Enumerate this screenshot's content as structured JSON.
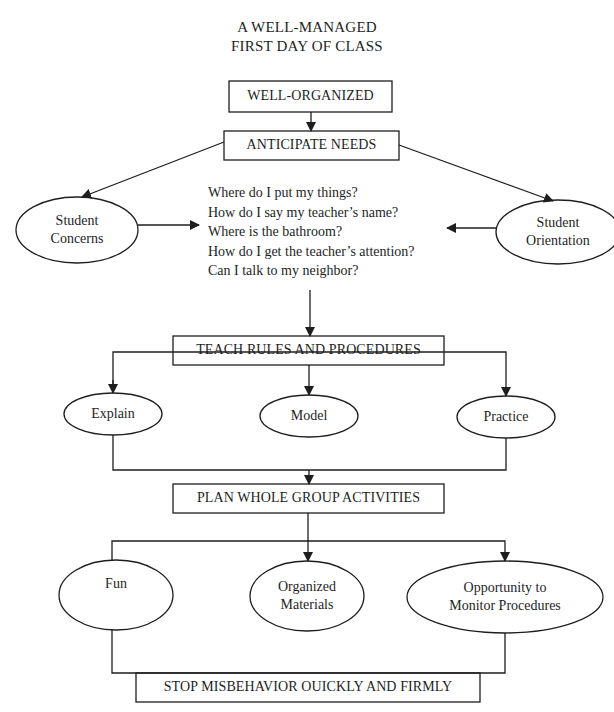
{
  "page": {
    "corner_mark": "g"
  },
  "diagram": {
    "title": {
      "line1": "A WELL-MANAGED",
      "line2": "FIRST DAY OF CLASS"
    },
    "nodes": {
      "well_organized": "WELL-ORGANIZED",
      "anticipate_needs": "ANTICIPATE NEEDS",
      "student_concerns": {
        "line1": "Student",
        "line2": "Concerns"
      },
      "student_orientation": {
        "line1": "Student",
        "line2": "Orientation"
      },
      "teach_rules": "TEACH RULES AND PROCEDURES",
      "explain": "Explain",
      "model": "Model",
      "practice": "Practice",
      "plan_activities": "PLAN WHOLE GROUP ACTIVITIES",
      "fun": "Fun",
      "organized_materials": {
        "line1": "Organized",
        "line2": "Materials"
      },
      "opportunity_monitor": {
        "line1": "Opportunity to",
        "line2": "Monitor Procedures"
      },
      "stop_misbehavior": "STOP MISBEHAVIOR OUICKLY AND FIRMLY"
    },
    "questions": [
      "Where do I put my things?",
      "How do I say my teacher’s name?",
      "Where is the bathroom?",
      "How do I get the teacher’s attention?",
      "Can I talk to my neighbor?"
    ],
    "edges": [
      [
        "well_organized",
        "anticipate_needs"
      ],
      [
        "anticipate_needs",
        "student_concerns"
      ],
      [
        "anticipate_needs",
        "student_orientation"
      ],
      [
        "student_concerns",
        "questions"
      ],
      [
        "student_orientation",
        "questions"
      ],
      [
        "questions",
        "teach_rules"
      ],
      [
        "teach_rules",
        "explain"
      ],
      [
        "teach_rules",
        "model"
      ],
      [
        "teach_rules",
        "practice"
      ],
      [
        "explain/model/practice",
        "plan_activities"
      ],
      [
        "plan_activities",
        "fun"
      ],
      [
        "plan_activities",
        "organized_materials"
      ],
      [
        "plan_activities",
        "opportunity_monitor"
      ],
      [
        "fun/organized_materials/opportunity_monitor",
        "stop_misbehavior"
      ]
    ],
    "colors": {
      "ink": "#1e1e1e",
      "background": "#ffffff"
    }
  }
}
